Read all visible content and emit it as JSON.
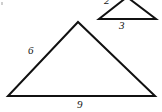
{
  "figure": {
    "background_color": "#ffffff",
    "stroke_color": "#111111",
    "label_color": "#141414",
    "canvas": {
      "width": 162,
      "height": 112
    }
  },
  "large_triangle": {
    "name": "large-triangle",
    "vertices": {
      "left": {
        "x": 8,
        "y": 96
      },
      "right": {
        "x": 155,
        "y": 96
      },
      "apex": {
        "x": 78,
        "y": 22
      }
    },
    "labels": {
      "left_side": "6",
      "base": "9"
    }
  },
  "small_triangle": {
    "name": "small-triangle",
    "note": "apex is cropped off the top edge of the image",
    "vertices": {
      "left": {
        "x": 99,
        "y": 19
      },
      "right": {
        "x": 156,
        "y": 19
      },
      "apex": {
        "x": 127,
        "y": -3
      }
    },
    "labels": {
      "left_side": "2",
      "base": "3"
    }
  },
  "chart_data": {
    "type": "diagram",
    "shapes": [
      {
        "id": "large-triangle",
        "kind": "triangle",
        "points": [
          [
            8,
            96
          ],
          [
            155,
            96
          ],
          [
            78,
            22
          ]
        ],
        "edge_labels": [
          {
            "edge": "left",
            "text": "6",
            "at": [
              32,
              50
            ]
          },
          {
            "edge": "base",
            "text": "9",
            "at": [
              82,
              105
            ]
          }
        ]
      },
      {
        "id": "small-triangle",
        "kind": "triangle",
        "points": [
          [
            99,
            19
          ],
          [
            156,
            19
          ],
          [
            127,
            -3
          ]
        ],
        "clipped": "apex cut off at top of image",
        "edge_labels": [
          {
            "edge": "left",
            "text": "2",
            "at": [
              108,
              1
            ]
          },
          {
            "edge": "base",
            "text": "3",
            "at": [
              122,
              25
            ]
          }
        ]
      }
    ]
  }
}
